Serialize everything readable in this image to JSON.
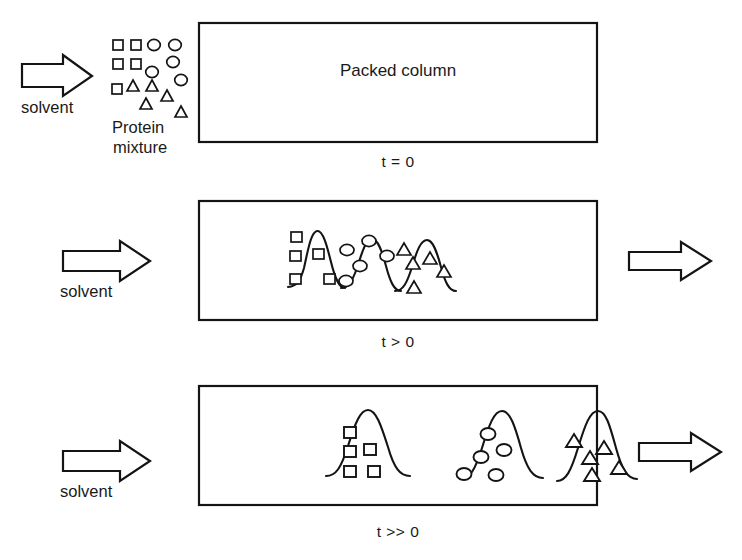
{
  "figure": {
    "title": "",
    "type": "process-diagram"
  },
  "labels": {
    "packed_column": "Packed column",
    "protein_mixture_line1": "Protein",
    "protein_mixture_line2": "mixture",
    "solvent": "solvent"
  },
  "stages": [
    {
      "id": "t0",
      "time_label": "t = 0",
      "column_label": "Packed column",
      "inlet_arrow": true,
      "inlet_label": "solvent",
      "outlet_arrow": false,
      "bands": []
    },
    {
      "id": "tgt0",
      "time_label": "t > 0",
      "column_label": "",
      "inlet_arrow": true,
      "inlet_label": "solvent",
      "outlet_arrow": true,
      "bands": [
        {
          "species": "square",
          "count": 5,
          "overlap": "high"
        },
        {
          "species": "circle",
          "count": 5,
          "overlap": "high"
        },
        {
          "species": "triangle",
          "count": 5,
          "overlap": "high"
        }
      ]
    },
    {
      "id": "tmuchgt0",
      "time_label": "t >> 0",
      "column_label": "",
      "inlet_arrow": true,
      "inlet_label": "solvent",
      "outlet_arrow": true,
      "bands": [
        {
          "species": "square",
          "count": 5,
          "overlap": "none"
        },
        {
          "species": "circle",
          "count": 5,
          "overlap": "none"
        },
        {
          "species": "triangle",
          "count": 5,
          "overlap": "none"
        }
      ]
    }
  ],
  "mixture": {
    "squares": 5,
    "circles": 5,
    "triangles": 5
  },
  "colors": {
    "stroke": "#141414",
    "fill": "#ffffff",
    "background": "#ffffff",
    "text": "#1a1a1a"
  }
}
